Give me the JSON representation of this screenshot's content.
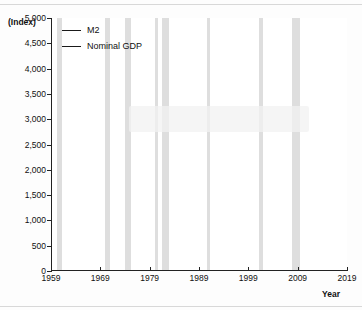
{
  "chart_data": {
    "type": "line",
    "title": "",
    "xlabel": "Year",
    "ylabel": "(Index)",
    "xlim": [
      1959,
      2019
    ],
    "ylim": [
      0,
      5000
    ],
    "grid": false,
    "legend_position": "top-left",
    "yticks": [
      "0",
      "500",
      "1,000",
      "1,500",
      "2,000",
      "2,500",
      "3,000",
      "3,500",
      "4,000",
      "4,500",
      "5,000"
    ],
    "ytick_values": [
      0,
      500,
      1000,
      1500,
      2000,
      2500,
      3000,
      3500,
      4000,
      4500,
      5000
    ],
    "xticks": [
      "1959",
      "1969",
      "1979",
      "1989",
      "1999",
      "2009",
      "2019"
    ],
    "xtick_values": [
      1959,
      1969,
      1979,
      1989,
      1999,
      2009,
      2019
    ],
    "x": [
      1959,
      1961,
      1963,
      1965,
      1967,
      1969,
      1971,
      1973,
      1975,
      1977,
      1979,
      1981,
      1983,
      1985,
      1987,
      1989,
      1991,
      1993,
      1995,
      1997,
      1999,
      2001,
      2003,
      2005,
      2007,
      2008,
      2009,
      2010,
      2011,
      2013,
      2015,
      2017,
      2019
    ],
    "series": [
      {
        "name": "M2",
        "color": "#1a1a1a",
        "values": [
          100,
          118,
          145,
          180,
          225,
          275,
          340,
          420,
          515,
          640,
          790,
          960,
          1150,
          1340,
          1490,
          1620,
          1790,
          1900,
          1960,
          2150,
          2420,
          2720,
          3000,
          3180,
          3440,
          3620,
          3900,
          4010,
          4300,
          4700,
          5300,
          5950,
          6600
        ],
        "display_values": [
          60,
          75,
          95,
          120,
          150,
          190,
          240,
          300,
          375,
          470,
          590,
          720,
          860,
          1000,
          1110,
          1210,
          1330,
          1410,
          1460,
          1600,
          1800,
          2020,
          2230,
          2370,
          2560,
          2700,
          2900,
          2990,
          3200,
          3500,
          3950,
          4350,
          4750
        ]
      },
      {
        "name": "Nominal GDP",
        "color": "#1a1a1a",
        "values": [
          100,
          115,
          140,
          172,
          210,
          258,
          312,
          395,
          480,
          605,
          780,
          975,
          1140,
          1370,
          1560,
          1800,
          1950,
          2150,
          2380,
          2700,
          3050,
          3350,
          3580,
          3980,
          4380,
          4480,
          4360,
          4500,
          4680,
          4950,
          5300,
          5700,
          6100
        ],
        "display_values": [
          60,
          72,
          88,
          108,
          132,
          162,
          196,
          248,
          302,
          380,
          490,
          613,
          716,
          861,
          980,
          1130,
          1225,
          1351,
          1495,
          1696,
          1916,
          2105,
          2250,
          2500,
          2752,
          2815,
          2740,
          2827,
          2940,
          3110,
          3330,
          3580,
          3830
        ]
      }
    ],
    "recession_bands": [
      {
        "start": 1960.3,
        "end": 1961.2
      },
      {
        "start": 1969.9,
        "end": 1970.9
      },
      {
        "start": 1973.9,
        "end": 1975.2
      },
      {
        "start": 1980.0,
        "end": 1980.6
      },
      {
        "start": 1981.5,
        "end": 1982.9
      },
      {
        "start": 1990.6,
        "end": 1991.2
      },
      {
        "start": 2001.2,
        "end": 2001.9
      },
      {
        "start": 2007.9,
        "end": 2009.5
      }
    ]
  },
  "legend": {
    "items": [
      {
        "label": "M2"
      },
      {
        "label": "Nominal GDP"
      }
    ]
  },
  "axis_captions": {
    "y": "(Index)",
    "x": "Year"
  }
}
